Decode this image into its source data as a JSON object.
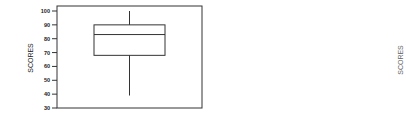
{
  "chart_data": {
    "type": "box",
    "title": "",
    "xlabel": "",
    "ylabel": "SCORES",
    "ylim": [
      30,
      100
    ],
    "yticks": [
      100,
      90,
      80,
      70,
      60,
      50,
      40,
      30
    ],
    "grid": false,
    "legend": null,
    "series": [
      {
        "name": "SCORES",
        "min": 39,
        "q1": 68,
        "median": 83,
        "q3": 90,
        "max": 100
      }
    ],
    "secondary_label": "SCORES"
  },
  "colors": {
    "stroke": "#333333",
    "text": "#222222",
    "faint_text": "#666666",
    "background": "#ffffff"
  }
}
